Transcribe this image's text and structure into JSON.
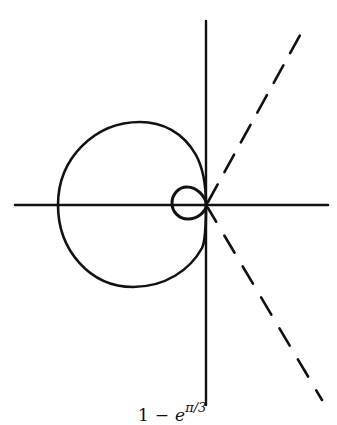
{
  "figure": {
    "colors": {
      "background": "#ffffff",
      "ink": "#111111"
    },
    "axes": {
      "horizontal": {
        "x1": 15,
        "x2": 328,
        "y": 205
      },
      "vertical": {
        "x": 206,
        "y1": 21,
        "y2": 405
      }
    },
    "curves": {
      "large_loop": {
        "left_x": 58,
        "top_y": 122,
        "bottom_y": 287
      },
      "small_loop": {
        "left_x": 172,
        "right_x": 207,
        "top_y": 187,
        "bottom_y": 219
      }
    },
    "dashed_rays": [
      {
        "name": "upper",
        "from": [
          206,
          205
        ],
        "to": [
          304,
          28
        ]
      },
      {
        "name": "lower",
        "from": [
          206,
          205
        ],
        "to": [
          322,
          400
        ]
      }
    ]
  },
  "caption": {
    "base": "1",
    "operator": "−",
    "term": "e",
    "exponent": "π/3"
  }
}
